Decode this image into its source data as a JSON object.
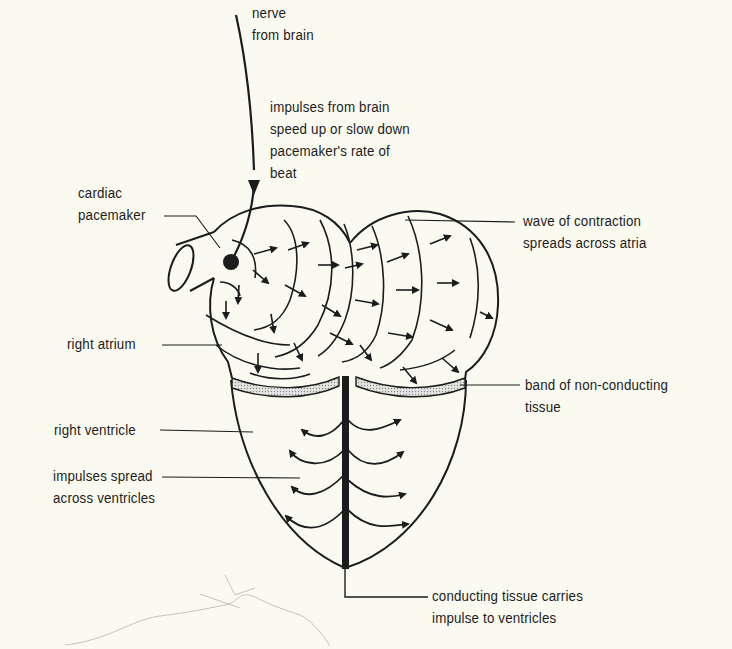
{
  "diagram": {
    "colors": {
      "background": "#fbfaf1",
      "ink": "#1c1c1c",
      "band_fill": "#cfcfcf"
    },
    "labels": {
      "nerve": {
        "line1": "nerve",
        "line2": "from brain"
      },
      "impulses_brain": {
        "line1": "impulses from brain",
        "line2": "speed up or slow down",
        "line3": "pacemaker's rate of",
        "line4": "beat"
      },
      "pacemaker": {
        "line1": "cardiac",
        "line2": "pacemaker"
      },
      "wave": {
        "line1": "wave of contraction",
        "line2": "spreads across atria"
      },
      "right_atrium": {
        "line1": "right atrium"
      },
      "band": {
        "line1": "band of non-conducting",
        "line2": "tissue"
      },
      "right_ventricle": {
        "line1": "right ventricle"
      },
      "impulses_spread": {
        "line1": "impulses spread",
        "line2": "across ventricles"
      },
      "conducting": {
        "line1": "conducting tissue carries",
        "line2": "impulse to ventricles"
      }
    }
  }
}
